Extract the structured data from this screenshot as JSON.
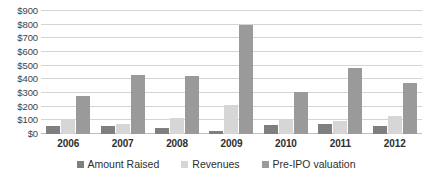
{
  "chart_data": {
    "type": "bar",
    "title": "",
    "subtitle": "",
    "xlabel": "",
    "ylabel": "",
    "categories": [
      "2006",
      "2007",
      "2008",
      "2009",
      "2010",
      "2011",
      "2012"
    ],
    "series": [
      {
        "name": "Amount Raised",
        "color": "#7f7f7f",
        "values": [
          55,
          60,
          45,
          25,
          65,
          70,
          60
        ]
      },
      {
        "name": "Revenues",
        "color": "#d6d6d6",
        "values": [
          100,
          75,
          120,
          215,
          100,
          95,
          135
        ]
      },
      {
        "name": "Pre-IPO valuation",
        "color": "#9a9a9a",
        "values": [
          275,
          435,
          425,
          800,
          305,
          480,
          375
        ]
      }
    ],
    "ylim": [
      0,
      900
    ],
    "ytick_step": 100,
    "ytick_labels": [
      "$0",
      "$100",
      "$200",
      "$300",
      "$400",
      "$500",
      "$600",
      "$700",
      "$800",
      "$900"
    ],
    "ytick_values": [
      0,
      100,
      200,
      300,
      400,
      500,
      600,
      700,
      800,
      900
    ],
    "grid": true,
    "grid_axis": "y",
    "legend_position": "bottom",
    "value_prefix": "$",
    "background_color": "#ffffff",
    "grid_color": "#d4d4d4"
  }
}
